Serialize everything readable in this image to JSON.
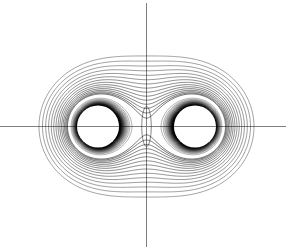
{
  "figure": {
    "title": "",
    "width": 293,
    "height": 251,
    "background_color": "#ffffff",
    "axis_color": "#808080",
    "contour_color": "#000000"
  },
  "axes": {
    "horizontal": {
      "name": "horizontal-axis",
      "y": 126.5,
      "x_start": 0,
      "x_end": 286,
      "label": ""
    },
    "vertical": {
      "name": "vertical-axis",
      "x": 146.5,
      "y_start": 3,
      "y_end": 247,
      "label": ""
    }
  },
  "chart_data": {
    "type": "line",
    "subtype": "contour",
    "title": "",
    "xlabel": "",
    "ylabel": "",
    "grid": false,
    "legend": null,
    "symmetry": [
      "about horizontal axis y=126.5",
      "about vertical axis x=146.5"
    ],
    "sources": [
      {
        "name": "left-source",
        "x": 98,
        "y": 126.5,
        "core_radius": 21,
        "sign": "+"
      },
      {
        "name": "right-source",
        "x": 195,
        "y": 126.5,
        "core_radius": 21,
        "sign": "+"
      }
    ],
    "saddle_point": {
      "x": 146.5,
      "y": 126.5
    },
    "saddle_pinch_top": {
      "x": 146.5,
      "y": 73
    },
    "saddle_pinch_bottom": {
      "x": 146.5,
      "y": 180
    },
    "center_lens": {
      "cx": 146.5,
      "cy": 126.5,
      "rx": 5,
      "ry": 20
    },
    "outer_contour_extent": {
      "x_min": 39,
      "x_max": 254,
      "y_min": 62,
      "y_max": 191
    },
    "levels": {
      "count": 46,
      "inner_levels": 30,
      "outer_levels": 16,
      "note": "Levels are logarithmically spaced; highest potentials crowd against the core circles."
    },
    "axis_ranges": {
      "xlim": [
        0,
        293
      ],
      "ylim": [
        0,
        251
      ]
    }
  }
}
